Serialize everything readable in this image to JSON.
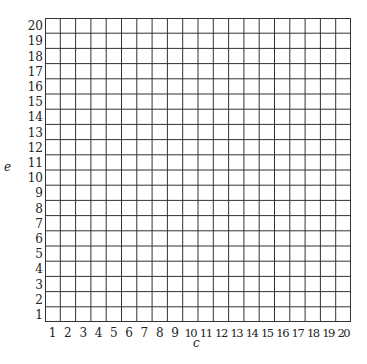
{
  "chart_data": {
    "type": "grid",
    "title": "",
    "xlabel": "c",
    "ylabel": "e",
    "x_ticks": [
      1,
      2,
      3,
      4,
      5,
      6,
      7,
      8,
      9,
      10,
      11,
      12,
      13,
      14,
      15,
      16,
      17,
      18,
      19,
      20
    ],
    "y_ticks": [
      1,
      2,
      3,
      4,
      5,
      6,
      7,
      8,
      9,
      10,
      11,
      12,
      13,
      14,
      15,
      16,
      17,
      18,
      19,
      20
    ],
    "xlim": [
      0,
      20
    ],
    "ylim": [
      0,
      20
    ],
    "grid": true,
    "series": []
  },
  "axes": {
    "x_title": "c",
    "y_title": "e"
  },
  "style": {
    "line_color": "#333333",
    "background": "#ffffff"
  }
}
